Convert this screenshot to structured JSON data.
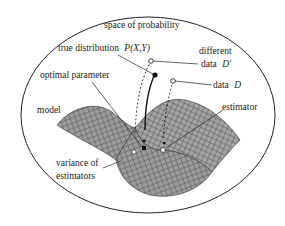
{
  "diagram": {
    "title": "space of probability",
    "labels": {
      "true_distribution": "true distribution",
      "true_distribution_formula": "P(X,Y)",
      "different": "different",
      "data_prime_prefix": "data",
      "data_prime_symbol": "D′",
      "data_prefix": "data",
      "data_symbol": "D",
      "optimal_parameter": "optimal parameter",
      "model": "model",
      "estimator": "estimator",
      "variance_line1": "variance of",
      "variance_line2": "estimators"
    },
    "colors": {
      "surface_fill": "#9a9a9a",
      "surface_grid": "#3a3a3a",
      "outline": "#222222",
      "background": "#ffffff"
    }
  }
}
